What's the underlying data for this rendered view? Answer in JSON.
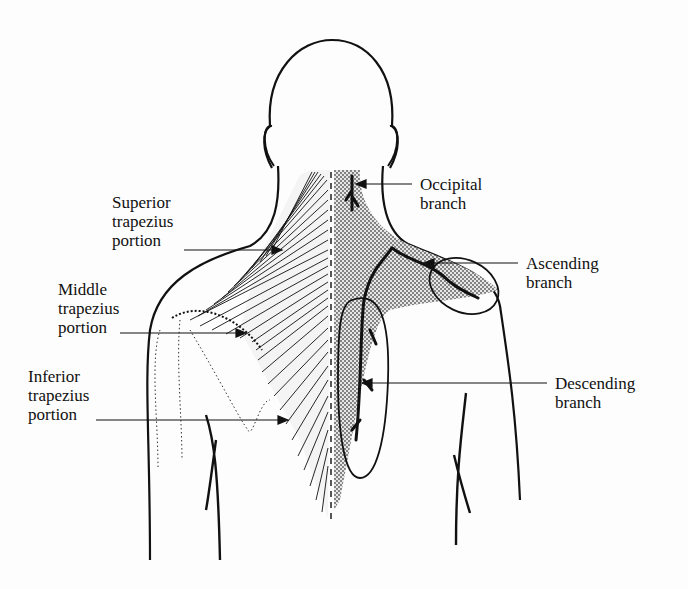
{
  "figure": {
    "left_labels": [
      {
        "id": "superior",
        "lines": [
          "Superior",
          "trapezius",
          "portion"
        ]
      },
      {
        "id": "middle",
        "lines": [
          "Middle",
          "trapezius",
          "portion"
        ]
      },
      {
        "id": "inferior",
        "lines": [
          "Inferior",
          "trapezius",
          "portion"
        ]
      }
    ],
    "right_labels": [
      {
        "id": "occipital",
        "lines": [
          "Occipital",
          "branch"
        ]
      },
      {
        "id": "ascending",
        "lines": [
          "Ascending",
          "branch"
        ]
      },
      {
        "id": "descending",
        "lines": [
          "Descending",
          "branch"
        ]
      }
    ],
    "colors": {
      "ink": "#111111",
      "background": "#fdfdfd",
      "stipple": "#9a9a9a"
    }
  }
}
